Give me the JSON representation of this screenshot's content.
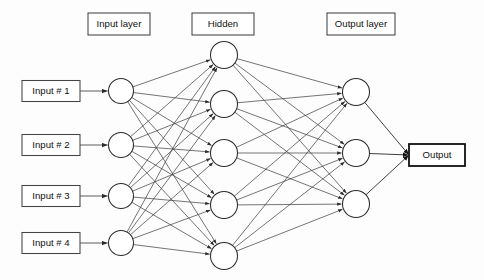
{
  "figure": {
    "background_color": "#fdfdfd",
    "line_color": "#3a3a3a",
    "node_fill": "#ffffff",
    "node_stroke": "#2b2b2b",
    "text_color": "#101010"
  },
  "layer_labels": [
    {
      "id": "input-layer",
      "text": "Input layer",
      "cx": 119,
      "cy": 24,
      "w": 62,
      "h": 22
    },
    {
      "id": "hidden",
      "text": "Hidden",
      "cx": 223,
      "cy": 24,
      "w": 62,
      "h": 22
    },
    {
      "id": "output-layer",
      "text": "Output layer",
      "cx": 361,
      "cy": 24,
      "w": 68,
      "h": 22
    }
  ],
  "input_boxes": [
    {
      "id": "input-1",
      "text": "Input # 1",
      "cx": 51,
      "cy": 91,
      "w": 58,
      "h": 21
    },
    {
      "id": "input-2",
      "text": "Input # 2",
      "cx": 51,
      "cy": 145,
      "w": 58,
      "h": 21
    },
    {
      "id": "input-3",
      "text": "Input # 3",
      "cx": 51,
      "cy": 196,
      "w": 58,
      "h": 21
    },
    {
      "id": "input-4",
      "text": "Input # 4",
      "cx": 51,
      "cy": 243,
      "w": 58,
      "h": 21
    }
  ],
  "output_box": {
    "id": "output",
    "text": "Output",
    "cx": 437,
    "cy": 155,
    "w": 56,
    "h": 22
  },
  "nodes": {
    "input": [
      {
        "id": "i1",
        "cx": 121,
        "cy": 91,
        "r": 12.5
      },
      {
        "id": "i2",
        "cx": 121,
        "cy": 145,
        "r": 12.5
      },
      {
        "id": "i3",
        "cx": 121,
        "cy": 196,
        "r": 12.5
      },
      {
        "id": "i4",
        "cx": 121,
        "cy": 243,
        "r": 12.5
      }
    ],
    "hidden": [
      {
        "id": "h1",
        "cx": 224,
        "cy": 55,
        "r": 13.5
      },
      {
        "id": "h2",
        "cx": 224,
        "cy": 104,
        "r": 13.5
      },
      {
        "id": "h3",
        "cx": 224,
        "cy": 153,
        "r": 13.5
      },
      {
        "id": "h4",
        "cx": 224,
        "cy": 205,
        "r": 13.5
      },
      {
        "id": "h5",
        "cx": 224,
        "cy": 256,
        "r": 13.5
      }
    ],
    "output": [
      {
        "id": "o1",
        "cx": 356,
        "cy": 92,
        "r": 13.5
      },
      {
        "id": "o2",
        "cx": 356,
        "cy": 153,
        "r": 13.5
      },
      {
        "id": "o3",
        "cx": 356,
        "cy": 204,
        "r": 13.5
      }
    ]
  },
  "topology": {
    "input_count": 4,
    "hidden_count": 5,
    "output_count": 3,
    "fully_connected": true,
    "input_to_hidden_edges": 20,
    "hidden_to_output_edges": 15,
    "direction": "left-to-right",
    "arrowheads": true
  }
}
